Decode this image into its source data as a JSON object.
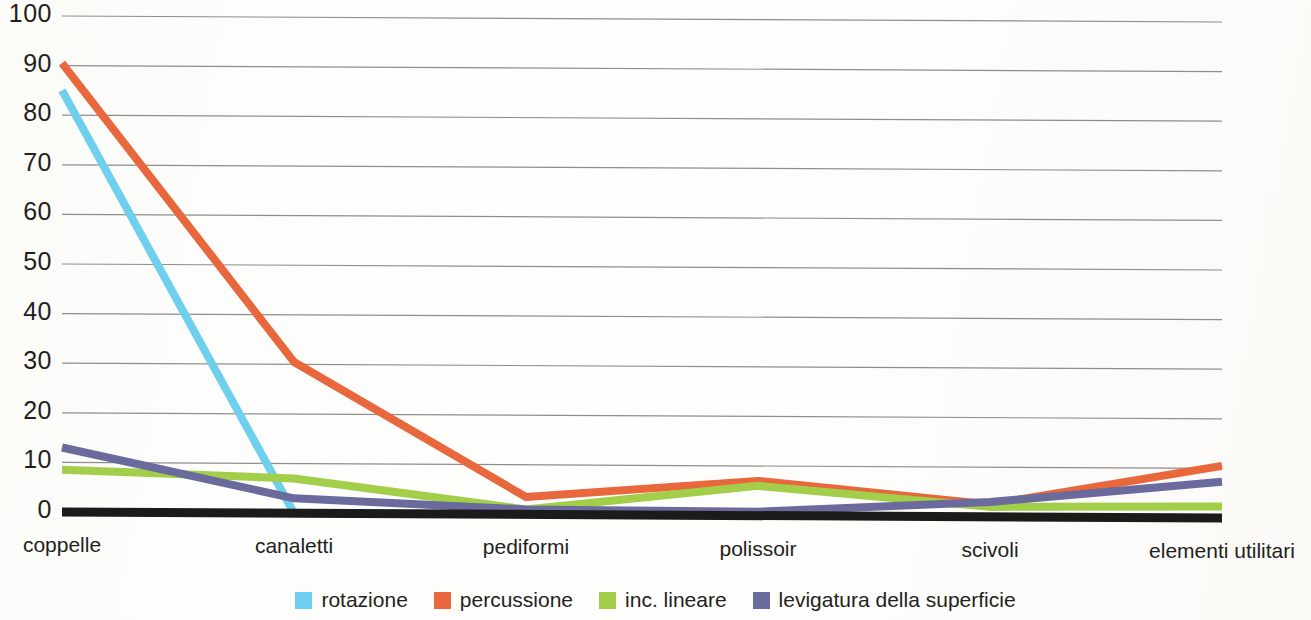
{
  "chart_data": {
    "type": "line",
    "title": "",
    "subtitle": "",
    "xlabel": "",
    "ylabel": "",
    "categories": [
      "coppelle",
      "canaletti",
      "pediformi",
      "polissoir",
      "scivoli",
      "elementi utilitari"
    ],
    "ylim": [
      0,
      100
    ],
    "yticks": [
      0,
      10,
      20,
      30,
      40,
      50,
      60,
      70,
      80,
      90,
      100
    ],
    "ytick_labels": [
      "0",
      "10",
      "20",
      "30",
      "40",
      "50",
      "60",
      "70",
      "80",
      "90",
      "100"
    ],
    "grid": true,
    "grid_axis": "y",
    "legend_position": "bottom",
    "series": [
      {
        "name": "rotazione",
        "color": "#6FD0EE",
        "values": [
          85,
          0,
          0,
          0,
          0,
          0
        ]
      },
      {
        "name": "percussione",
        "color": "#E8673C",
        "values": [
          90.5,
          30.5,
          3.5,
          7,
          2.5,
          10.5
        ]
      },
      {
        "name": "inc. lineare",
        "color": "#A2CE4A",
        "values": [
          8.5,
          7,
          1,
          6,
          2,
          2.3
        ]
      },
      {
        "name": "levigatura della superficie",
        "color": "#6A6A9C",
        "values": [
          13,
          3,
          1,
          0.8,
          3,
          7.3
        ]
      }
    ]
  },
  "legend": {
    "items": [
      {
        "label": "rotazione",
        "color": "#6FD0EE"
      },
      {
        "label": "percussione",
        "color": "#E8673C"
      },
      {
        "label": "inc. lineare",
        "color": "#A2CE4A"
      },
      {
        "label": "levigatura della superficie",
        "color": "#6A6A9C"
      }
    ]
  },
  "axis": {
    "baseline_color": "#1b1b1b",
    "gridline_color": "#8e8e8e"
  }
}
